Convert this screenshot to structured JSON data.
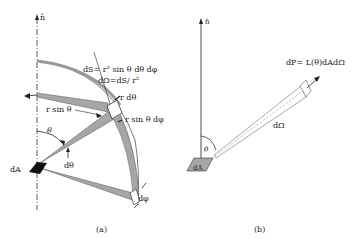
{
  "panel_a": {
    "normal_label": "n̂",
    "dS_label": "dS= r² sin θ dθ dφ",
    "dOmega_label": "dΩ=dS/ r²",
    "r_dtheta_label": "r dθ",
    "r_sin_theta_label": "r sin θ",
    "r_sin_theta_dphi_label": "r sin θ dφ",
    "theta_label": "θ",
    "dtheta_label": "dθ",
    "dA_label": "dA",
    "dphi_label": "dφ",
    "caption": "(a)"
  },
  "panel_b": {
    "normal_label": "n̂",
    "dP_label": "dP= L(θ)dAdΩ",
    "dOmega_label": "dΩ",
    "theta_label": "θ",
    "dA_label": "dA",
    "caption": "(b)"
  },
  "colors": {
    "fill_gray": "#a6a6a6",
    "dark": "#111111",
    "line": "#333333"
  }
}
